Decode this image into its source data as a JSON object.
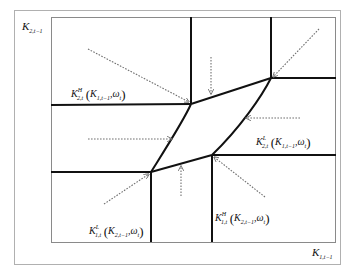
{
  "diagram": {
    "type": "phase-diagram",
    "colors": {
      "frame": "#9a9a9a",
      "boundary": "#111111",
      "arrow": "#707070",
      "background": "#ffffff"
    },
    "axes": {
      "y_label": {
        "base": "K",
        "sub": "2,t−1"
      },
      "x_label": {
        "base": "K",
        "sub": "1,t−1"
      }
    },
    "curves": [
      {
        "id": "K2t_H",
        "base": "K",
        "sub": "2,t",
        "sup": "H",
        "arg_base": "K",
        "arg_sub": "1,t−1",
        "omega": "ω",
        "omega_sub": "t"
      },
      {
        "id": "K2t_L",
        "base": "K",
        "sub": "2,t",
        "sup": "L",
        "arg_base": "K",
        "arg_sub": "1,t−1",
        "omega": "ω",
        "omega_sub": "t"
      },
      {
        "id": "K1t_L",
        "base": "K",
        "sub": "1,t",
        "sup": "L",
        "arg_base": "K",
        "arg_sub": "2,t−1",
        "omega": "ω",
        "omega_sub": "t"
      },
      {
        "id": "K1t_H",
        "base": "K",
        "sub": "1,t",
        "sup": "H",
        "arg_base": "K",
        "arg_sub": "2,t−1",
        "omega": "ω",
        "omega_sub": "t"
      }
    ],
    "nodes": {
      "upper_left": [
        191,
        104
      ],
      "upper_right": [
        271,
        78
      ],
      "lower_right": [
        212,
        155
      ],
      "lower_left": [
        151,
        172
      ]
    },
    "arrow_count": 8
  }
}
